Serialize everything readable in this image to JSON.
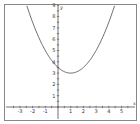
{
  "chart_data": {
    "type": "line",
    "title": "",
    "xlabel": "x",
    "ylabel": "y",
    "xlim": [
      -3.5,
      5.5
    ],
    "ylim": [
      -0.5,
      9
    ],
    "grid": false,
    "x_ticks": [
      -3,
      -2,
      -1,
      1,
      2,
      3,
      4,
      5
    ],
    "y_ticks": [
      1,
      2,
      3,
      4,
      5,
      6,
      7,
      8,
      9
    ],
    "series": [
      {
        "name": "y = 0.5(x - 1)^2 + 3",
        "function": "0.5*(x-1)^2+3",
        "vertex": [
          1,
          3
        ],
        "y_intercept": 3.5,
        "x": [
          -2.5,
          -2,
          -1,
          0,
          1,
          2,
          3,
          4,
          4.5
        ],
        "values": [
          9.125,
          7.5,
          5,
          3.5,
          3,
          3.5,
          5,
          7.5,
          9.125
        ]
      }
    ]
  },
  "colors": {
    "frame": "#888888",
    "axis": "#333333",
    "curve": "#444444"
  }
}
